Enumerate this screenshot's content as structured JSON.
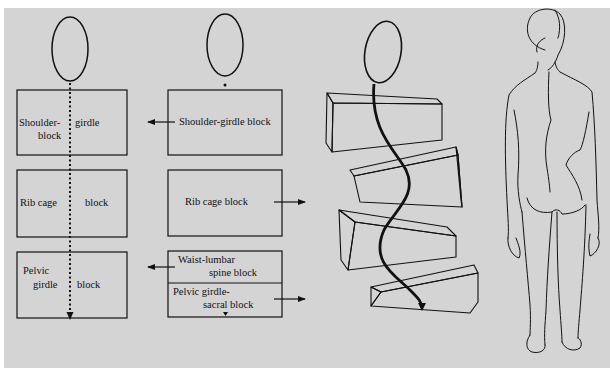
{
  "figure": {
    "background": "#d4d4d4",
    "line_color": "#111111",
    "panel_a": {
      "description": "Normal alignment: head over stacked body blocks with straight dotted center line",
      "blocks": [
        {
          "label_left": "Shoulder-",
          "label_left_2": "block",
          "label_right": "girdle"
        },
        {
          "label_left": "Rib cage",
          "label_right": "block"
        },
        {
          "label_left": "Pelvic",
          "label_left_2": "girdle",
          "label_right": "block"
        }
      ]
    },
    "panel_b": {
      "description": "Displaced blocks with direction arrows",
      "blocks": [
        {
          "label": "Shoulder-girdle block",
          "arrow": "left"
        },
        {
          "label": "Rib cage block",
          "arrow": "right"
        },
        {
          "label": "Waist-lumbar",
          "label_2": "spine block",
          "arrow": "left"
        },
        {
          "label": "Pelvic girdle-",
          "label_2": "sacral block",
          "arrow": "right"
        }
      ]
    },
    "panel_c": {
      "description": "Rotated 3D wedge blocks with curved spine arrow"
    },
    "panel_d": {
      "description": "Posterior view of human figure showing scoliotic curve"
    }
  }
}
